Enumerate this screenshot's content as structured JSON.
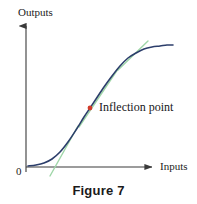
{
  "figure": {
    "caption": "Figure 7",
    "background_color": "#ffffff"
  },
  "axes": {
    "y_axis_label": "Outputs",
    "x_axis_label": "Inputs",
    "origin_label": "0",
    "axis_color": "#3a3a3a",
    "y_axis": {
      "x": 26,
      "y_top": 22,
      "y_bottom": 172,
      "arrow": "up"
    },
    "x_axis": {
      "y": 167,
      "x_left": 26,
      "x_right": 157,
      "arrow": "right"
    },
    "ticks": [],
    "grid": false
  },
  "annotations": {
    "inflection_label": "Inflection point",
    "inflection_marker_color": "#d13b2a",
    "inflection_point_px": {
      "x": 90,
      "y": 108
    }
  },
  "chart_data": {
    "type": "line",
    "title": "Figure 7",
    "xlabel": "Inputs",
    "ylabel": "Outputs",
    "grid": false,
    "legend": null,
    "xlim": [
      0,
      1
    ],
    "ylim": [
      0,
      1
    ],
    "series": [
      {
        "name": "sigmoid-curve",
        "color": "#2c3e6b",
        "width": 1.6,
        "points_px": [
          [
            28,
            166
          ],
          [
            36,
            165
          ],
          [
            44,
            163
          ],
          [
            52,
            159
          ],
          [
            60,
            152
          ],
          [
            68,
            142
          ],
          [
            76,
            130
          ],
          [
            84,
            117
          ],
          [
            90,
            108
          ],
          [
            96,
            99
          ],
          [
            104,
            87
          ],
          [
            112,
            76
          ],
          [
            120,
            66
          ],
          [
            128,
            58
          ],
          [
            136,
            53
          ],
          [
            144,
            49
          ],
          [
            152,
            47
          ],
          [
            160,
            46
          ],
          [
            167,
            45
          ],
          [
            173,
            45
          ]
        ]
      }
    ],
    "tangents": [
      {
        "name": "tangent-lower",
        "color": "#9fd6a8",
        "width": 1.4,
        "x1": 50,
        "y1": 176,
        "x2": 78,
        "y2": 126
      },
      {
        "name": "tangent-inflection",
        "color": "#9fd6a8",
        "width": 1.4,
        "x1": 79,
        "y1": 127,
        "x2": 118,
        "y2": 69
      },
      {
        "name": "tangent-upper",
        "color": "#9fd6a8",
        "width": 1.4,
        "x1": 118,
        "y1": 70,
        "x2": 148,
        "y2": 41
      }
    ],
    "markers": [
      {
        "name": "inflection-point",
        "x_px": 90,
        "y_px": 108,
        "color": "#d13b2a",
        "radius": 2.4,
        "label": "Inflection point"
      }
    ]
  }
}
